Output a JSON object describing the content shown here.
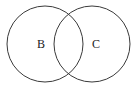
{
  "diagram": {
    "type": "venn",
    "sets": [
      {
        "label": "B",
        "cx": 45,
        "cy": 44,
        "r": 38
      },
      {
        "label": "C",
        "cx": 92,
        "cy": 44,
        "r": 38
      }
    ],
    "stroke_color": "#3a3a3a",
    "background": "#ffffff"
  }
}
